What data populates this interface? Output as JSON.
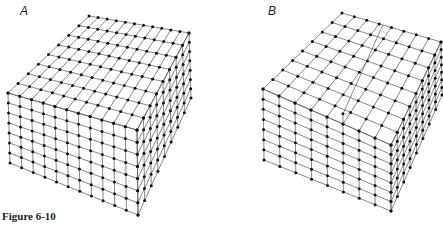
{
  "panels": [
    {
      "label": "A",
      "description": "Perfect crystal lattice block",
      "grid": {
        "cols_front": 11,
        "cols_side": 8,
        "rows": 7
      },
      "corners": {
        "left_top": [
          8,
          93
        ],
        "front_top": [
          137,
          130
        ],
        "right_top": [
          189,
          33
        ],
        "back_top": [
          89,
          16
        ],
        "left_bottom": [
          10,
          163
        ],
        "front_bottom": [
          138,
          215
        ],
        "right_bottom": [
          191,
          98
        ]
      },
      "step": null
    },
    {
      "label": "B",
      "description": "Lattice block with a screw dislocation step",
      "grid": {
        "cols_front": 8,
        "cols_side": 8,
        "rows": 7
      },
      "corners": {
        "left_top": [
          263,
          89
        ],
        "front_top": [
          391,
          145
        ],
        "right_top": [
          441,
          42
        ],
        "back_top": [
          342,
          13
        ],
        "left_bottom": [
          264,
          160
        ],
        "front_bottom": [
          391,
          211
        ],
        "right_bottom": [
          442,
          95
        ]
      },
      "step": {
        "at_col": 5,
        "height_rows": 1
      }
    }
  ],
  "caption": "Figure 6-10",
  "colors": {
    "line": "#555555",
    "node": "#111111"
  }
}
